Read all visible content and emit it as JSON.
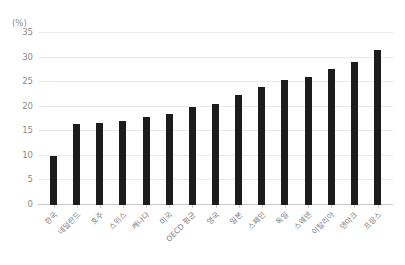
{
  "chart_data": {
    "type": "bar",
    "title": "",
    "subtitle": "",
    "xlabel": "",
    "ylabel": "",
    "unit_label": "(%)",
    "ylim": [
      0,
      35
    ],
    "yticks": [
      0,
      5,
      10,
      15,
      20,
      25,
      30,
      35
    ],
    "ytick_labels": [
      "0",
      "5",
      "10",
      "15",
      "20",
      "25",
      "30",
      "35"
    ],
    "grid": true,
    "legend": false,
    "legend_position": "none",
    "bar_color": "#1c1c1c",
    "gridline_color": "#ebebeb",
    "axis_color": "#c9c9c9",
    "tick_label_color": "#8a8a8a",
    "categories": [
      "한국",
      "네덜란드",
      "호주",
      "스위스",
      "캐나다",
      "미국",
      "OECD 평균",
      "영국",
      "일본",
      "스페인",
      "독일",
      "스웨덴",
      "이탈리아",
      "덴마크",
      "프랑스"
    ],
    "values": [
      10.0,
      16.5,
      16.7,
      17.0,
      18.0,
      18.5,
      20.0,
      20.5,
      22.3,
      24.0,
      25.4,
      26.0,
      27.7,
      29.2,
      31.5
    ]
  }
}
